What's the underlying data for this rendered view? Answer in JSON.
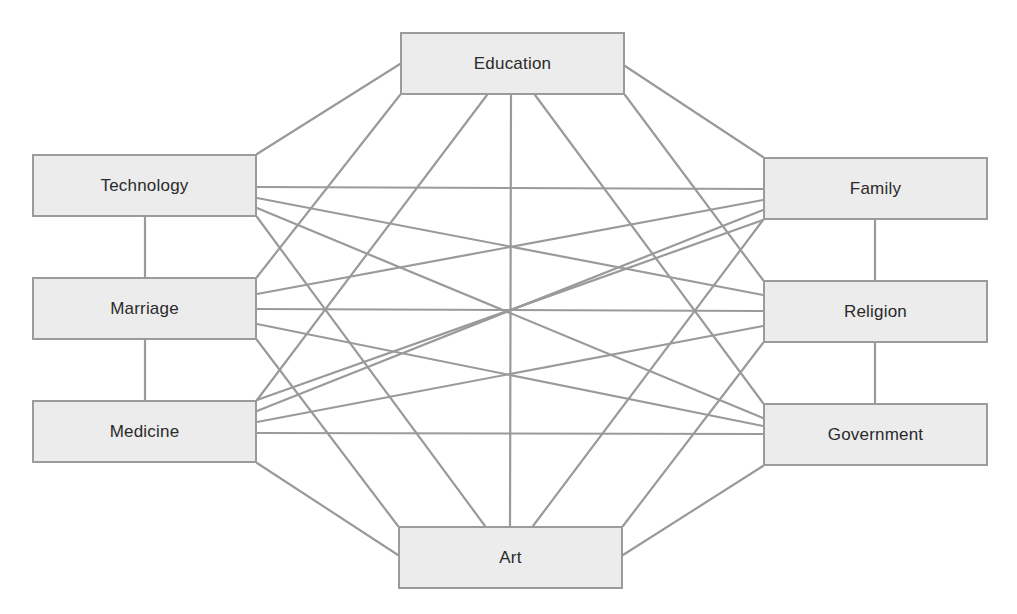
{
  "diagram": {
    "type": "fully-connected concept network",
    "style": {
      "node_fill": "#ececec",
      "node_border": "#9b9b9b",
      "edge_color": "#9a9a9a",
      "text_color": "#2a2a2a",
      "background": "#ffffff"
    },
    "nodes": [
      {
        "id": "education",
        "label": "Education",
        "x": 400,
        "y": 32,
        "w": 225,
        "h": 63
      },
      {
        "id": "technology",
        "label": "Technology",
        "x": 32,
        "y": 154,
        "w": 225,
        "h": 63
      },
      {
        "id": "marriage",
        "label": "Marriage",
        "x": 32,
        "y": 277,
        "w": 225,
        "h": 63
      },
      {
        "id": "medicine",
        "label": "Medicine",
        "x": 32,
        "y": 400,
        "w": 225,
        "h": 63
      },
      {
        "id": "family",
        "label": "Family",
        "x": 763,
        "y": 157,
        "w": 225,
        "h": 63
      },
      {
        "id": "religion",
        "label": "Religion",
        "x": 763,
        "y": 280,
        "w": 225,
        "h": 63
      },
      {
        "id": "government",
        "label": "Government",
        "x": 763,
        "y": 403,
        "w": 225,
        "h": 63
      },
      {
        "id": "art",
        "label": "Art",
        "x": 398,
        "y": 526,
        "w": 225,
        "h": 63
      }
    ],
    "edges": [
      {
        "from": "education",
        "to": "technology",
        "x1": 400,
        "y1": 64,
        "x2": 257,
        "y2": 154
      },
      {
        "from": "education",
        "to": "marriage",
        "x1": 400,
        "y1": 95,
        "x2": 257,
        "y2": 277
      },
      {
        "from": "education",
        "to": "medicine",
        "x1": 487,
        "y1": 95,
        "x2": 257,
        "y2": 400
      },
      {
        "from": "education",
        "to": "art",
        "x1": 511,
        "y1": 95,
        "x2": 510,
        "y2": 526
      },
      {
        "from": "education",
        "to": "government",
        "x1": 535,
        "y1": 95,
        "x2": 763,
        "y2": 403
      },
      {
        "from": "education",
        "to": "religion",
        "x1": 625,
        "y1": 95,
        "x2": 763,
        "y2": 280
      },
      {
        "from": "education",
        "to": "family",
        "x1": 625,
        "y1": 66,
        "x2": 763,
        "y2": 157
      },
      {
        "from": "technology",
        "to": "marriage",
        "x1": 145,
        "y1": 217,
        "x2": 145,
        "y2": 277
      },
      {
        "from": "marriage",
        "to": "medicine",
        "x1": 145,
        "y1": 340,
        "x2": 145,
        "y2": 400
      },
      {
        "from": "family",
        "to": "religion",
        "x1": 875,
        "y1": 220,
        "x2": 875,
        "y2": 280
      },
      {
        "from": "religion",
        "to": "government",
        "x1": 875,
        "y1": 343,
        "x2": 875,
        "y2": 403
      },
      {
        "from": "technology",
        "to": "family",
        "x1": 257,
        "y1": 187,
        "x2": 763,
        "y2": 189
      },
      {
        "from": "technology",
        "to": "religion",
        "x1": 257,
        "y1": 198,
        "x2": 763,
        "y2": 295
      },
      {
        "from": "technology",
        "to": "government",
        "x1": 257,
        "y1": 208,
        "x2": 763,
        "y2": 418
      },
      {
        "from": "technology",
        "to": "art",
        "x1": 257,
        "y1": 217,
        "x2": 485,
        "y2": 526
      },
      {
        "from": "marriage",
        "to": "family",
        "x1": 257,
        "y1": 294,
        "x2": 763,
        "y2": 200
      },
      {
        "from": "marriage",
        "to": "religion",
        "x1": 257,
        "y1": 309,
        "x2": 763,
        "y2": 311
      },
      {
        "from": "marriage",
        "to": "government",
        "x1": 257,
        "y1": 324,
        "x2": 763,
        "y2": 426
      },
      {
        "from": "marriage",
        "to": "art",
        "x1": 257,
        "y1": 340,
        "x2": 398,
        "y2": 526
      },
      {
        "from": "medicine",
        "to": "family",
        "x1": 257,
        "y1": 411,
        "x2": 763,
        "y2": 210
      },
      {
        "from": "medicine",
        "to": "religion",
        "x1": 257,
        "y1": 422,
        "x2": 763,
        "y2": 326
      },
      {
        "from": "medicine",
        "to": "government",
        "x1": 257,
        "y1": 433,
        "x2": 763,
        "y2": 434
      },
      {
        "from": "medicine",
        "to": "art",
        "x1": 257,
        "y1": 463,
        "x2": 398,
        "y2": 555
      },
      {
        "from": "family",
        "to": "medicine-tr",
        "x1": 763,
        "y1": 220,
        "x2": 257,
        "y2": 400
      },
      {
        "from": "family",
        "to": "art",
        "x1": 763,
        "y1": 220,
        "x2": 533,
        "y2": 526
      },
      {
        "from": "religion",
        "to": "marriage-tr",
        "x1": 763,
        "y1": 343,
        "x2": 623,
        "y2": 526
      },
      {
        "from": "government",
        "to": "art",
        "x1": 763,
        "y1": 466,
        "x2": 623,
        "y2": 555
      }
    ]
  }
}
